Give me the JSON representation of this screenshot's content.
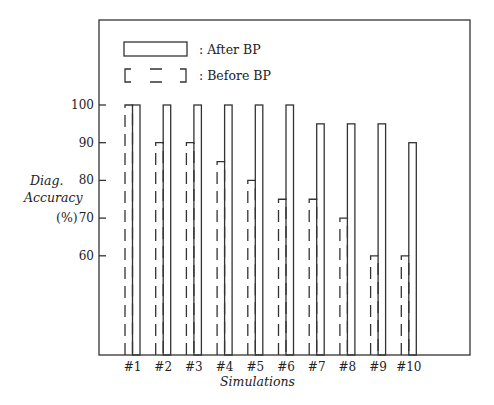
{
  "chart_data": {
    "type": "bar",
    "title": "",
    "xlabel": "Simulations",
    "ylabel": [
      "Diag.",
      "Accuracy",
      "(%)"
    ],
    "categories": [
      "#1",
      "#2",
      "#3",
      "#4",
      "#5",
      "#6",
      "#7",
      "#8",
      "#9",
      "#10"
    ],
    "series": [
      {
        "name": "Before BP",
        "style": "dashed",
        "values": [
          100,
          90,
          90,
          85,
          80,
          75,
          75,
          70,
          60,
          60
        ]
      },
      {
        "name": "After BP",
        "style": "solid",
        "values": [
          100,
          100,
          100,
          100,
          100,
          100,
          95,
          95,
          95,
          90
        ]
      }
    ],
    "yticks": [
      60,
      70,
      80,
      90,
      100
    ],
    "ylim": [
      37,
      120
    ],
    "grid": false,
    "legend_position": "top-left inside"
  },
  "legend": {
    "after_label": ": After BP",
    "before_label": ": Before BP"
  },
  "axis": {
    "xlabel": "Simulations",
    "ylabel_line1": "Diag.",
    "ylabel_line2": "Accuracy",
    "ylabel_line3": "(%)"
  }
}
